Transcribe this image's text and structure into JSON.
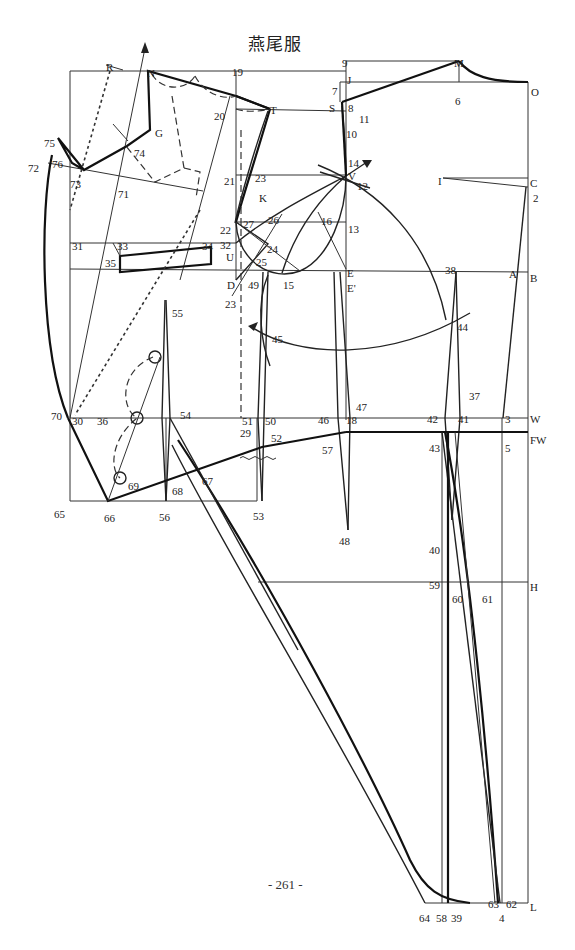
{
  "title": "燕尾服",
  "page_number": "- 261 -",
  "diagram": {
    "colors": {
      "line": "#222222",
      "background": "#ffffff"
    },
    "point_labels": [
      {
        "id": "R",
        "x": 106,
        "y": 62
      },
      {
        "id": "N",
        "x": 147,
        "y": 68
      },
      {
        "id": "19",
        "x": 232,
        "y": 67
      },
      {
        "id": "9",
        "x": 342,
        "y": 58
      },
      {
        "id": "M",
        "x": 454,
        "y": 58
      },
      {
        "id": "J",
        "x": 347,
        "y": 75
      },
      {
        "id": "7",
        "x": 332,
        "y": 86
      },
      {
        "id": "O",
        "x": 531,
        "y": 87
      },
      {
        "id": "6",
        "x": 455,
        "y": 96
      },
      {
        "id": "S",
        "x": 329,
        "y": 103
      },
      {
        "id": "8",
        "x": 348,
        "y": 103
      },
      {
        "id": "11",
        "x": 359,
        "y": 114
      },
      {
        "id": "10",
        "x": 346,
        "y": 129
      },
      {
        "id": "20",
        "x": 214,
        "y": 111
      },
      {
        "id": "T",
        "x": 270,
        "y": 105
      },
      {
        "id": "G",
        "x": 155,
        "y": 128
      },
      {
        "id": "75",
        "x": 44,
        "y": 138
      },
      {
        "id": "74",
        "x": 134,
        "y": 148
      },
      {
        "id": "76",
        "x": 52,
        "y": 159
      },
      {
        "id": "72",
        "x": 28,
        "y": 163
      },
      {
        "id": "73",
        "x": 70,
        "y": 179
      },
      {
        "id": "71",
        "x": 118,
        "y": 189
      },
      {
        "id": "14",
        "x": 348,
        "y": 158
      },
      {
        "id": "21",
        "x": 224,
        "y": 176
      },
      {
        "id": "23",
        "x": 255,
        "y": 173
      },
      {
        "id": "V",
        "x": 348,
        "y": 171
      },
      {
        "id": "12",
        "x": 357,
        "y": 181
      },
      {
        "id": "K",
        "x": 259,
        "y": 193
      },
      {
        "id": "I",
        "x": 438,
        "y": 176
      },
      {
        "id": "C",
        "x": 530,
        "y": 178
      },
      {
        "id": "2",
        "x": 533,
        "y": 193
      },
      {
        "id": "26",
        "x": 268,
        "y": 215
      },
      {
        "id": "16",
        "x": 321,
        "y": 216
      },
      {
        "id": "22",
        "x": 220,
        "y": 225
      },
      {
        "id": "27",
        "x": 243,
        "y": 219
      },
      {
        "id": "13",
        "x": 348,
        "y": 224
      },
      {
        "id": "31",
        "x": 72,
        "y": 241
      },
      {
        "id": "33",
        "x": 117,
        "y": 241
      },
      {
        "id": "34",
        "x": 202,
        "y": 241
      },
      {
        "id": "32",
        "x": 220,
        "y": 240
      },
      {
        "id": "24",
        "x": 267,
        "y": 244
      },
      {
        "id": "U",
        "x": 226,
        "y": 252
      },
      {
        "id": "25",
        "x": 256,
        "y": 257
      },
      {
        "id": "35",
        "x": 105,
        "y": 258
      },
      {
        "id": "D",
        "x": 227,
        "y": 280
      },
      {
        "id": "49",
        "x": 248,
        "y": 280
      },
      {
        "id": "15",
        "x": 283,
        "y": 280
      },
      {
        "id": "E",
        "x": 347,
        "y": 268
      },
      {
        "id": "E'",
        "x": 347,
        "y": 283
      },
      {
        "id": "38",
        "x": 445,
        "y": 265
      },
      {
        "id": "A",
        "x": 509,
        "y": 269
      },
      {
        "id": "B",
        "x": 530,
        "y": 273
      },
      {
        "id": "23b",
        "x": 225,
        "y": 299,
        "label": "23"
      },
      {
        "id": "55",
        "x": 172,
        "y": 308
      },
      {
        "id": "44",
        "x": 457,
        "y": 322
      },
      {
        "id": "45",
        "x": 272,
        "y": 334
      },
      {
        "id": "47",
        "x": 356,
        "y": 402
      },
      {
        "id": "37",
        "x": 469,
        "y": 391
      },
      {
        "id": "70",
        "x": 51,
        "y": 411
      },
      {
        "id": "30",
        "x": 72,
        "y": 416
      },
      {
        "id": "36",
        "x": 97,
        "y": 416
      },
      {
        "id": "54",
        "x": 180,
        "y": 410
      },
      {
        "id": "51",
        "x": 242,
        "y": 416
      },
      {
        "id": "50",
        "x": 265,
        "y": 416
      },
      {
        "id": "46",
        "x": 318,
        "y": 415
      },
      {
        "id": "18",
        "x": 346,
        "y": 415
      },
      {
        "id": "42",
        "x": 427,
        "y": 414
      },
      {
        "id": "41",
        "x": 458,
        "y": 414
      },
      {
        "id": "3",
        "x": 505,
        "y": 414
      },
      {
        "id": "W",
        "x": 530,
        "y": 414
      },
      {
        "id": "29",
        "x": 240,
        "y": 428
      },
      {
        "id": "52",
        "x": 271,
        "y": 433
      },
      {
        "id": "57",
        "x": 322,
        "y": 445
      },
      {
        "id": "43",
        "x": 429,
        "y": 443
      },
      {
        "id": "5",
        "x": 505,
        "y": 443
      },
      {
        "id": "FW",
        "x": 530,
        "y": 435
      },
      {
        "id": "69",
        "x": 128,
        "y": 481
      },
      {
        "id": "67",
        "x": 202,
        "y": 476
      },
      {
        "id": "68",
        "x": 172,
        "y": 486
      },
      {
        "id": "65",
        "x": 54,
        "y": 509
      },
      {
        "id": "66",
        "x": 104,
        "y": 513
      },
      {
        "id": "56",
        "x": 159,
        "y": 512
      },
      {
        "id": "53",
        "x": 253,
        "y": 511
      },
      {
        "id": "48",
        "x": 339,
        "y": 536
      },
      {
        "id": "40",
        "x": 429,
        "y": 545
      },
      {
        "id": "59",
        "x": 429,
        "y": 580
      },
      {
        "id": "60",
        "x": 452,
        "y": 594
      },
      {
        "id": "61",
        "x": 482,
        "y": 594
      },
      {
        "id": "H",
        "x": 530,
        "y": 582
      },
      {
        "id": "63",
        "x": 488,
        "y": 899
      },
      {
        "id": "62",
        "x": 506,
        "y": 899
      },
      {
        "id": "L",
        "x": 530,
        "y": 902
      },
      {
        "id": "64",
        "x": 419,
        "y": 913
      },
      {
        "id": "58",
        "x": 436,
        "y": 913
      },
      {
        "id": "39",
        "x": 451,
        "y": 913
      },
      {
        "id": "4",
        "x": 499,
        "y": 913
      }
    ]
  }
}
